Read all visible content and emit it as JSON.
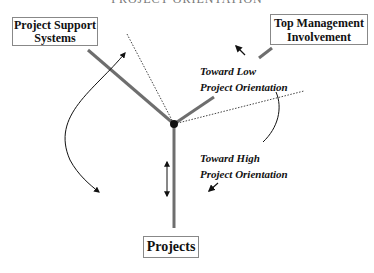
{
  "title": "PROJECT ORIENTATION",
  "boxes": {
    "support": [
      "Project Support",
      "Systems"
    ],
    "top_management": [
      "Top Management",
      "Involvement"
    ],
    "projects": "Projects"
  },
  "labels": {
    "toward_low": [
      "Toward Low",
      "Project Orientation"
    ],
    "toward_high": [
      "Toward High",
      "Project Orientation"
    ]
  },
  "colors": {
    "axis": "#6e6e6e",
    "arrow": "#111111",
    "dotted": "#444444"
  }
}
